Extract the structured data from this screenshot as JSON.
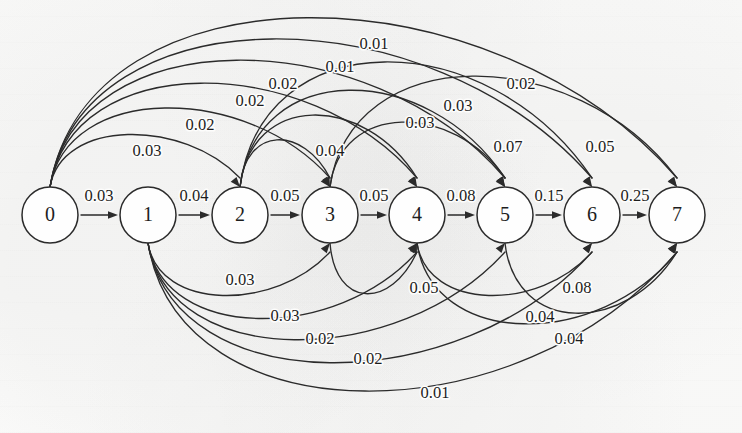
{
  "diagram": {
    "type": "directed-graph",
    "background_color": "#fdfdfc",
    "stroke_color": "#2b2b2b",
    "node_fill": "#fefefe",
    "nodes": [
      {
        "id": "0",
        "label": "0",
        "cx": 50,
        "cy": 215,
        "r": 28
      },
      {
        "id": "1",
        "label": "1",
        "cx": 148,
        "cy": 215,
        "r": 28
      },
      {
        "id": "2",
        "label": "2",
        "cx": 240,
        "cy": 215,
        "r": 28
      },
      {
        "id": "3",
        "label": "3",
        "cx": 330,
        "cy": 215,
        "r": 28
      },
      {
        "id": "4",
        "label": "4",
        "cx": 417,
        "cy": 215,
        "r": 28
      },
      {
        "id": "5",
        "label": "5",
        "cx": 505,
        "cy": 215,
        "r": 28
      },
      {
        "id": "6",
        "label": "6",
        "cx": 592,
        "cy": 215,
        "r": 28
      },
      {
        "id": "7",
        "label": "7",
        "cx": 677,
        "cy": 215,
        "r": 28
      }
    ],
    "straight_edges": [
      {
        "from": "0",
        "to": "1",
        "weight": "0.03",
        "lx": 99,
        "ly": 197
      },
      {
        "from": "1",
        "to": "2",
        "weight": "0.04",
        "lx": 194,
        "ly": 197
      },
      {
        "from": "2",
        "to": "3",
        "weight": "0.05",
        "lx": 285,
        "ly": 197
      },
      {
        "from": "3",
        "to": "4",
        "weight": "0.05",
        "lx": 374,
        "ly": 197
      },
      {
        "from": "4",
        "to": "5",
        "weight": "0.08",
        "lx": 461,
        "ly": 197
      },
      {
        "from": "5",
        "to": "6",
        "weight": "0.15",
        "lx": 549,
        "ly": 197
      },
      {
        "from": "6",
        "to": "7",
        "weight": "0.25",
        "lx": 635,
        "ly": 197
      }
    ],
    "upper_arcs": [
      {
        "from": "0",
        "to": "2",
        "weight": "0.03",
        "lift": 58,
        "lx": 147,
        "ly": 152
      },
      {
        "from": "0",
        "to": "3",
        "weight": "0.02",
        "lift": 88,
        "lx": 200,
        "ly": 126
      },
      {
        "from": "0",
        "to": "4",
        "weight": "0.02",
        "lift": 116,
        "lx": 250,
        "ly": 102
      },
      {
        "from": "0",
        "to": "5",
        "weight": "0.02",
        "lift": 142,
        "lx": 283,
        "ly": 85
      },
      {
        "from": "0",
        "to": "6",
        "weight": "0.01",
        "lift": 166,
        "lx": 340,
        "ly": 68
      },
      {
        "from": "0",
        "to": "7",
        "weight": "0.01",
        "lift": 190,
        "lx": 374,
        "ly": 45
      },
      {
        "from": "2",
        "to": "3",
        "weight": "0.04",
        "lift": 52,
        "lx": 330,
        "ly": 152
      },
      {
        "from": "2",
        "to": "4",
        "weight": "0.03",
        "lift": 80,
        "lx": 420,
        "ly": 124
      },
      {
        "from": "2",
        "to": "5",
        "weight": "0.03",
        "lift": 108,
        "lx": 458,
        "ly": 107
      },
      {
        "from": "2",
        "to": "6",
        "weight": "0.02",
        "lift": 140,
        "lx": 521,
        "ly": 85
      },
      {
        "from": "3",
        "to": "5",
        "weight": "0.07",
        "lift": 72,
        "lx": 508,
        "ly": 148
      },
      {
        "from": "3",
        "to": "7",
        "weight": "0.05",
        "lift": 124,
        "lx": 600,
        "ly": 148
      }
    ],
    "lower_arcs": [
      {
        "from": "1",
        "to": "3",
        "weight": "0.03",
        "lift": 58,
        "lx": 240,
        "ly": 281
      },
      {
        "from": "1",
        "to": "4",
        "weight": "0.03",
        "lift": 84,
        "lx": 285,
        "ly": 317
      },
      {
        "from": "1",
        "to": "5",
        "weight": "0.02",
        "lift": 108,
        "lx": 320,
        "ly": 340
      },
      {
        "from": "1",
        "to": "6",
        "weight": "0.02",
        "lift": 134,
        "lx": 368,
        "ly": 360
      },
      {
        "from": "1",
        "to": "7",
        "weight": "0.01",
        "lift": 166,
        "lx": 435,
        "ly": 394
      },
      {
        "from": "3",
        "to": "4",
        "weight": "0.05",
        "lift": 56,
        "lx": 424,
        "ly": 289
      },
      {
        "from": "4",
        "to": "6",
        "weight": "0.08",
        "lift": 58,
        "lx": 577,
        "ly": 289
      },
      {
        "from": "4",
        "to": "7",
        "weight": "0.04",
        "lift": 90,
        "lx": 540,
        "ly": 318
      },
      {
        "from": "5",
        "to": "7",
        "weight": "0.04",
        "lift": 78,
        "lx": 569,
        "ly": 340
      }
    ]
  }
}
